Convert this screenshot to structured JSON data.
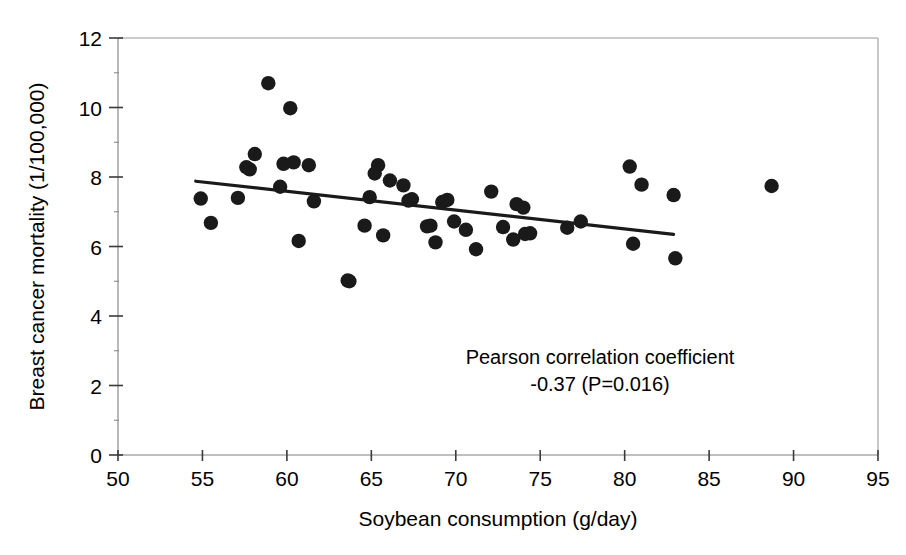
{
  "chart_data": {
    "type": "scatter",
    "title": "",
    "xlabel": "Soybean consumption (g/day)",
    "ylabel": "Breast cancer mortality (1/100,000)",
    "xlim": [
      50,
      95
    ],
    "ylim": [
      0,
      12
    ],
    "xticks": [
      50,
      55,
      60,
      65,
      70,
      75,
      80,
      85,
      90,
      95
    ],
    "xtick_labels": [
      "50",
      "55",
      "60",
      "65",
      "70",
      "75",
      "80",
      "85",
      "90",
      "95"
    ],
    "yticks": [
      0,
      2,
      4,
      6,
      8,
      10,
      12
    ],
    "ytick_labels": [
      "0",
      "2",
      "4",
      "6",
      "8",
      "10",
      "12"
    ],
    "grid": false,
    "legend": "none",
    "marker": "filled-circle",
    "marker_color": "#1a1a1a",
    "points": [
      {
        "x": 54.9,
        "y": 7.38
      },
      {
        "x": 55.5,
        "y": 6.68
      },
      {
        "x": 57.1,
        "y": 7.4
      },
      {
        "x": 57.6,
        "y": 8.28
      },
      {
        "x": 57.8,
        "y": 8.22
      },
      {
        "x": 58.1,
        "y": 8.66
      },
      {
        "x": 58.9,
        "y": 10.7
      },
      {
        "x": 59.6,
        "y": 7.72
      },
      {
        "x": 59.8,
        "y": 8.38
      },
      {
        "x": 60.2,
        "y": 9.98
      },
      {
        "x": 60.4,
        "y": 8.42
      },
      {
        "x": 60.7,
        "y": 6.16
      },
      {
        "x": 61.3,
        "y": 8.34
      },
      {
        "x": 61.6,
        "y": 7.3
      },
      {
        "x": 63.6,
        "y": 5.02
      },
      {
        "x": 63.7,
        "y": 5.0
      },
      {
        "x": 64.6,
        "y": 6.6
      },
      {
        "x": 64.9,
        "y": 7.42
      },
      {
        "x": 65.2,
        "y": 8.1
      },
      {
        "x": 65.4,
        "y": 8.34
      },
      {
        "x": 65.7,
        "y": 6.32
      },
      {
        "x": 66.1,
        "y": 7.9
      },
      {
        "x": 66.9,
        "y": 7.76
      },
      {
        "x": 67.2,
        "y": 7.32
      },
      {
        "x": 67.4,
        "y": 7.36
      },
      {
        "x": 68.3,
        "y": 6.58
      },
      {
        "x": 68.5,
        "y": 6.6
      },
      {
        "x": 68.8,
        "y": 6.12
      },
      {
        "x": 69.2,
        "y": 7.28
      },
      {
        "x": 69.5,
        "y": 7.34
      },
      {
        "x": 69.9,
        "y": 6.72
      },
      {
        "x": 70.6,
        "y": 6.48
      },
      {
        "x": 71.2,
        "y": 5.92
      },
      {
        "x": 72.1,
        "y": 7.58
      },
      {
        "x": 72.8,
        "y": 6.56
      },
      {
        "x": 73.4,
        "y": 6.2
      },
      {
        "x": 73.6,
        "y": 7.22
      },
      {
        "x": 74.0,
        "y": 7.12
      },
      {
        "x": 74.1,
        "y": 6.36
      },
      {
        "x": 74.4,
        "y": 6.38
      },
      {
        "x": 76.6,
        "y": 6.54
      },
      {
        "x": 77.4,
        "y": 6.72
      },
      {
        "x": 80.3,
        "y": 8.3
      },
      {
        "x": 80.5,
        "y": 6.08
      },
      {
        "x": 81.0,
        "y": 7.78
      },
      {
        "x": 82.9,
        "y": 7.48
      },
      {
        "x": 83.0,
        "y": 5.66
      },
      {
        "x": 88.7,
        "y": 7.74
      }
    ],
    "trendline": {
      "x_start": 54.6,
      "y_start": 7.88,
      "x_end": 82.9,
      "y_end": 6.35,
      "color": "#1a1a1a"
    },
    "annotation": {
      "line1": "Pearson correlation coefficient",
      "line2": "-0.37 (P=0.016)"
    }
  }
}
